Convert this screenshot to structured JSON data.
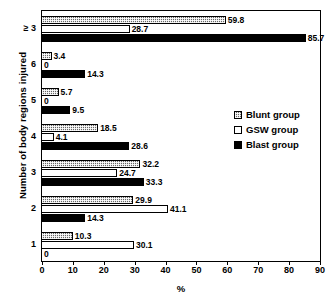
{
  "chart_data": {
    "type": "bar",
    "orientation": "horizontal",
    "title": "",
    "xlabel": "%",
    "ylabel": "Number of body regions injured",
    "xlim": [
      0,
      90
    ],
    "xticks": [
      0,
      10,
      20,
      30,
      40,
      50,
      60,
      70,
      80,
      90
    ],
    "grid": false,
    "legend_position": "right-middle",
    "categories": [
      "≥ 3",
      "6",
      "5",
      "4",
      "3",
      "2",
      "1"
    ],
    "series": [
      {
        "name": "Blunt group",
        "values": [
          59.8,
          3.4,
          5.7,
          18.5,
          32.2,
          29.9,
          10.3
        ],
        "color": "#b4b4b4",
        "pattern": "stipple"
      },
      {
        "name": "GSW group",
        "values": [
          28.7,
          0,
          0,
          4.1,
          24.7,
          41.1,
          30.1
        ],
        "color": "#ffffff",
        "pattern": "solid"
      },
      {
        "name": "Blast group",
        "values": [
          85.7,
          14.3,
          9.5,
          28.6,
          33.3,
          14.3,
          0
        ],
        "color": "#000000",
        "pattern": "solid"
      }
    ],
    "data_labels": [
      {
        "category": "≥ 3",
        "blunt": "59.8",
        "gsw": "28.7",
        "blast": "85.7"
      },
      {
        "category": "6",
        "blunt": "3.4",
        "gsw": "0",
        "blast": "14.3"
      },
      {
        "category": "5",
        "blunt": "5.7",
        "gsw": "0",
        "blast": "9.5"
      },
      {
        "category": "4",
        "blunt": "18.5",
        "gsw": "4.1",
        "blast": "28.6"
      },
      {
        "category": "3",
        "blunt": "32.2",
        "gsw": "24.7",
        "blast": "33.3"
      },
      {
        "category": "2",
        "blunt": "29.9",
        "gsw": "41.1",
        "blast": "14.3"
      },
      {
        "category": "1",
        "blunt": "10.3",
        "gsw": "30.1",
        "blast": "0"
      }
    ]
  },
  "legend": {
    "items": [
      {
        "label": "Blunt group"
      },
      {
        "label": "GSW group"
      },
      {
        "label": "Blast group"
      }
    ]
  },
  "axes": {
    "x_title": "%",
    "y_title": "Number of body regions injured",
    "x_tick_labels": [
      "0",
      "10",
      "20",
      "30",
      "40",
      "50",
      "60",
      "70",
      "80",
      "90"
    ],
    "y_tick_labels": [
      "≥ 3",
      "6",
      "5",
      "4",
      "3",
      "2",
      "1"
    ]
  }
}
